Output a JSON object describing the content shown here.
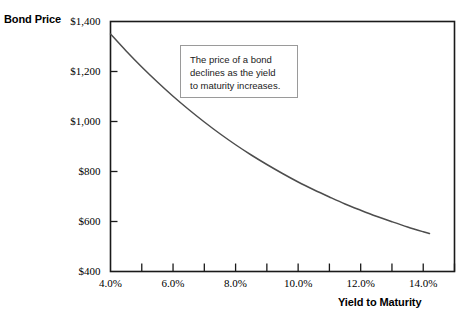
{
  "chart_data": {
    "type": "line",
    "title": "",
    "xlabel": "Yield to Maturity",
    "ylabel": "Bond Price",
    "xlim": [
      4.0,
      15.0
    ],
    "ylim": [
      400,
      1400
    ],
    "grid": false,
    "legend": null,
    "x_tick_labels": [
      "4.0%",
      "6.0%",
      "8.0%",
      "10.0%",
      "12.0%",
      "14.0%"
    ],
    "x_tick_values": [
      4.0,
      6.0,
      8.0,
      10.0,
      12.0,
      14.0
    ],
    "x_minor_tick_values": [
      5.0,
      7.0,
      9.0,
      11.0,
      13.0,
      15.0
    ],
    "y_tick_labels": [
      "$400",
      "$600",
      "$800",
      "$1,000",
      "$1,200",
      "$1,400"
    ],
    "y_tick_values": [
      400,
      600,
      800,
      1000,
      1200,
      1400
    ],
    "series": [
      {
        "name": "Bond Price",
        "x": [
          4.0,
          4.5,
          5.0,
          5.5,
          6.0,
          6.5,
          7.0,
          7.5,
          8.0,
          8.5,
          9.0,
          9.5,
          10.0,
          10.5,
          11.0,
          11.5,
          12.0,
          12.5,
          13.0,
          13.5,
          14.0,
          14.2
        ],
        "values": [
          1350,
          1282,
          1218,
          1158,
          1101,
          1048,
          998,
          951,
          907,
          866,
          828,
          792,
          758,
          727,
          698,
          670,
          645,
          621,
          599,
          578,
          559,
          552
        ]
      }
    ],
    "annotations": [
      {
        "name": "price-yield-note",
        "lines": [
          "The price of a bond",
          "declines as the yield",
          "to maturity increases."
        ]
      }
    ]
  },
  "axes": {
    "y_title": "Bond Price",
    "x_title": "Yield to Maturity"
  },
  "colors": {
    "curve": "#4d4d4d",
    "axis": "#1a1a1a",
    "annotation_border": "#9a9a9a",
    "text": "#000000",
    "background": "#ffffff"
  }
}
